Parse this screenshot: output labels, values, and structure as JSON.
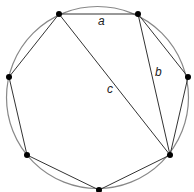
{
  "diagram": {
    "circle": {
      "cx": 97.5,
      "cy": 97.5,
      "r": 91,
      "stroke": "#888888"
    },
    "vertices": [
      {
        "x": 59,
        "y": 14
      },
      {
        "x": 138,
        "y": 14
      },
      {
        "x": 188,
        "y": 77
      },
      {
        "x": 170,
        "y": 155
      },
      {
        "x": 99,
        "y": 190
      },
      {
        "x": 27,
        "y": 155
      },
      {
        "x": 9,
        "y": 77
      }
    ],
    "edge_color": "#333333",
    "vertex_color": "#000000",
    "diagonals": [
      {
        "from": 0,
        "to": 3,
        "label": "c"
      },
      {
        "from": 1,
        "to": 3,
        "label": "b"
      }
    ],
    "labels": [
      {
        "text": "a",
        "x": 98,
        "y": 25
      },
      {
        "text": "b",
        "x": 155,
        "y": 76
      },
      {
        "text": "c",
        "x": 107,
        "y": 93
      }
    ]
  }
}
